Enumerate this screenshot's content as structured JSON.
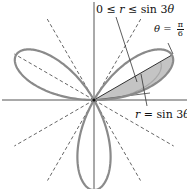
{
  "figure": {
    "curve_equation": "r = sin 3θ",
    "leaf_count": 3,
    "leaf_directions_deg": [
      30,
      150,
      270
    ],
    "reference_lines_deg": [
      30,
      60,
      120,
      150
    ],
    "shaded_region": {
      "theta_from": "0",
      "theta_to": "π/6",
      "description": "0 ≤ r ≤ sin 3θ"
    },
    "colors": {
      "curve": "#8a8a8a",
      "shade": "#c4c4c4",
      "axes": "#555555",
      "dashed": "#555555",
      "text": "#111111"
    }
  },
  "labels": {
    "region": {
      "prefix": "0 ≤ ",
      "var": "r",
      "mid": " ≤ sin 3",
      "theta": "θ"
    },
    "theta_line": {
      "theta": "θ",
      "eq": " = ",
      "num": "π",
      "den": "6"
    },
    "curve": {
      "var": "r",
      "eq": " = sin 3",
      "theta": "θ"
    }
  }
}
